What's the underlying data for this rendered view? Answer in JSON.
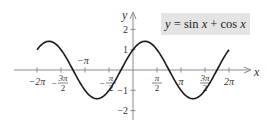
{
  "chart_data": {
    "type": "line",
    "title": "",
    "legend": {
      "text": "y = sin x + cos x",
      "position": "top-right",
      "background": "#e4e4e4"
    },
    "xlabel": "x",
    "ylabel": "y",
    "xlim": [
      -6.2832,
      6.2832
    ],
    "ylim": [
      -2,
      2
    ],
    "grid": false,
    "x_ticks": [
      {
        "value": -6.2832,
        "label": "−2π"
      },
      {
        "value": -4.7124,
        "label": "−3π/2"
      },
      {
        "value": -3.1416,
        "label": "−π"
      },
      {
        "value": -1.5708,
        "label": "−π/2"
      },
      {
        "value": 1.5708,
        "label": "π/2"
      },
      {
        "value": 3.1416,
        "label": "π"
      },
      {
        "value": 4.7124,
        "label": "3π/2"
      },
      {
        "value": 6.2832,
        "label": "2π"
      }
    ],
    "y_ticks": [
      {
        "value": 2,
        "label": "2"
      },
      {
        "value": 1,
        "label": "1"
      },
      {
        "value": -1,
        "label": "−1"
      },
      {
        "value": -2,
        "label": "−2"
      }
    ],
    "series": [
      {
        "name": "y = sin x + cos x",
        "function": "sin(x)+cos(x)",
        "color": "#1a1a1a",
        "x": [
          -6.2832,
          -5.4978,
          -4.7124,
          -3.927,
          -3.1416,
          -2.3562,
          -1.5708,
          -0.7854,
          0,
          0.7854,
          1.5708,
          2.3562,
          3.1416,
          3.927,
          4.7124,
          5.4978,
          6.2832
        ],
        "values": [
          1,
          1.414,
          1,
          0,
          -1,
          -1.414,
          -1,
          0,
          1,
          1.414,
          1,
          0,
          -1,
          -1.414,
          -1,
          0,
          1
        ]
      }
    ]
  },
  "legend_parts": {
    "y": "y",
    "eq": " = sin ",
    "x1": "x",
    "plus": " + cos ",
    "x2": "x"
  }
}
